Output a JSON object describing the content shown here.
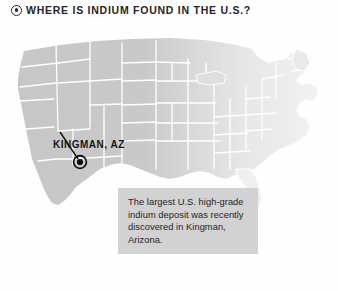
{
  "header": {
    "bullet_icon": "circled-dot-icon",
    "title": "WHERE IS INDIUM FOUND IN THE U.S.?"
  },
  "map": {
    "alt": "united-states-map",
    "region_highlight": "western-united-states",
    "marker": {
      "icon": "map-pin-ring-icon",
      "label": "KINGMAN, AZ",
      "leader_line": "label-to-marker-line"
    }
  },
  "callout": {
    "text": "The largest U.S. high-grade indium deposit was recently discovered in Kingman, Arizona.",
    "background": "#d2d2d2"
  },
  "colors": {
    "map_fill_west": "#c9c9c9",
    "map_fill_east": "#ededed",
    "map_border": "#ffffff",
    "marker": "#000000",
    "text": "#1e1e1e",
    "page_background": "#ffffff"
  }
}
